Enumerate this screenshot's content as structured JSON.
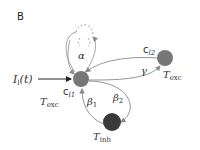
{
  "panel_label": "B",
  "colors": {
    "exc_node": "#777777",
    "inh_node": "#3a3a3a",
    "edge": "#888888",
    "input_edge": "#222222",
    "text": "#333333"
  },
  "nodes": [
    {
      "id": "c_l1",
      "label": "c",
      "sub": "l1",
      "type_label": "T",
      "type_sub": "exc"
    },
    {
      "id": "c_l2",
      "label": "c",
      "sub": "l2",
      "type_label": "T",
      "type_sub": "exc"
    },
    {
      "id": "inh",
      "type_label": "T",
      "type_sub": "inh"
    }
  ],
  "input": {
    "label": "I",
    "sub": "l",
    "arg": "(t)"
  },
  "edges": {
    "alpha": "α",
    "gamma": "γ",
    "beta1": "β",
    "beta1_sub": "1",
    "beta2": "β",
    "beta2_sub": "2"
  }
}
